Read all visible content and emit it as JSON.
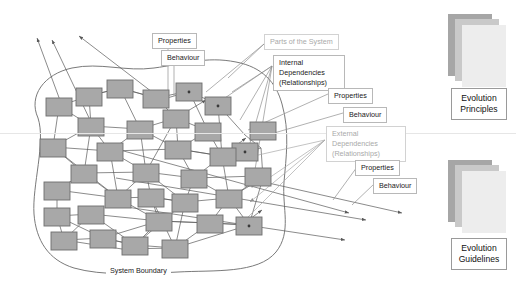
{
  "diagram": {
    "title_label": "System Boundary",
    "callouts": [
      {
        "id": "properties-top",
        "text": "Properties",
        "x": 152,
        "y": 33,
        "muted": false
      },
      {
        "id": "behaviour-top",
        "text": "Behaviour",
        "x": 161,
        "y": 50,
        "muted": false
      },
      {
        "id": "parts-of-system",
        "text": "Parts of the System",
        "x": 264,
        "y": 34,
        "muted": true
      },
      {
        "id": "internal-deps",
        "text": "Internal Dependencies (Relationships)",
        "x": 273,
        "y": 55,
        "muted": false
      },
      {
        "id": "properties-mid",
        "text": "Properties",
        "x": 328,
        "y": 88,
        "muted": false
      },
      {
        "id": "behaviour-mid",
        "text": "Behaviour",
        "x": 343,
        "y": 107,
        "muted": false
      },
      {
        "id": "external-deps",
        "text": "External Dependencies (Relationships)",
        "x": 326,
        "y": 126,
        "muted": true
      },
      {
        "id": "properties-low",
        "text": "Properties",
        "x": 355,
        "y": 160,
        "muted": false
      },
      {
        "id": "behaviour-low",
        "text": "Behaviour",
        "x": 373,
        "y": 178,
        "muted": false
      }
    ],
    "stacks": [
      {
        "id": "evolution-principles",
        "label": "Evolution\nPrinciples",
        "line1": "Evolution",
        "line2": "Principles",
        "x": 448,
        "y": 14,
        "label_y": 88
      },
      {
        "id": "evolution-guidelines",
        "label": "Evolution\nGuidelines",
        "line1": "Evolution",
        "line2": "Guidelines",
        "x": 448,
        "y": 160,
        "label_y": 238
      }
    ],
    "colors": {
      "node_fill": "#a8a8a8",
      "node_stroke": "#6e6e6e",
      "edge": "#595959",
      "boundary": "#7a7a7a",
      "muted_text": "#a9a9a9",
      "label_border": "#b8b8b8",
      "sheet_dark": "#a6a6a6",
      "sheet_mid": "#c9c9c9",
      "sheet_light": "#ededed"
    },
    "node_count": 34,
    "nodes": [
      {
        "id": "n1",
        "x": 46,
        "y": 98
      },
      {
        "id": "n2",
        "x": 76,
        "y": 88
      },
      {
        "id": "n3",
        "x": 107,
        "y": 80
      },
      {
        "id": "n4",
        "x": 143,
        "y": 90
      },
      {
        "id": "n5",
        "x": 176,
        "y": 83,
        "dot": true
      },
      {
        "id": "n6",
        "x": 205,
        "y": 97,
        "dot": true
      },
      {
        "id": "n7",
        "x": 78,
        "y": 118
      },
      {
        "id": "n8",
        "x": 127,
        "y": 121
      },
      {
        "id": "n9",
        "x": 163,
        "y": 110
      },
      {
        "id": "n10",
        "x": 195,
        "y": 123
      },
      {
        "id": "n11",
        "x": 40,
        "y": 139
      },
      {
        "id": "n12",
        "x": 97,
        "y": 143
      },
      {
        "id": "n13",
        "x": 165,
        "y": 141
      },
      {
        "id": "n14",
        "x": 232,
        "y": 143,
        "dot": true
      },
      {
        "id": "n15",
        "x": 71,
        "y": 165
      },
      {
        "id": "n16",
        "x": 133,
        "y": 164
      },
      {
        "id": "n17",
        "x": 181,
        "y": 170
      },
      {
        "id": "n18",
        "x": 245,
        "y": 168
      },
      {
        "id": "n19",
        "x": 44,
        "y": 182
      },
      {
        "id": "n20",
        "x": 105,
        "y": 190
      },
      {
        "id": "n21",
        "x": 138,
        "y": 189
      },
      {
        "id": "n22",
        "x": 172,
        "y": 194
      },
      {
        "id": "n23",
        "x": 216,
        "y": 190
      },
      {
        "id": "n24",
        "x": 44,
        "y": 208
      },
      {
        "id": "n25",
        "x": 78,
        "y": 206
      },
      {
        "id": "n26",
        "x": 146,
        "y": 213
      },
      {
        "id": "n27",
        "x": 197,
        "y": 215
      },
      {
        "id": "n28",
        "x": 236,
        "y": 217,
        "dot": true
      },
      {
        "id": "n29",
        "x": 51,
        "y": 232
      },
      {
        "id": "n30",
        "x": 90,
        "y": 230
      },
      {
        "id": "n31",
        "x": 122,
        "y": 237
      },
      {
        "id": "n32",
        "x": 162,
        "y": 240
      },
      {
        "id": "n33",
        "x": 250,
        "y": 122
      },
      {
        "id": "n34",
        "x": 210,
        "y": 148
      }
    ]
  }
}
